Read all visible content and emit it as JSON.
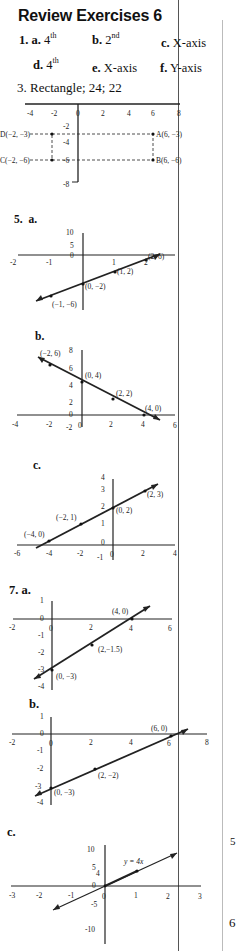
{
  "title": "Review Exercises 6",
  "exercise1": {
    "number": "1.",
    "items": [
      {
        "letter": "a.",
        "answer": "4",
        "sup": "th"
      },
      {
        "letter": "b.",
        "answer": "2",
        "sup": "nd"
      },
      {
        "letter": "c.",
        "answer": "X-axis"
      },
      {
        "letter": "d.",
        "answer": "4",
        "sup": "th"
      },
      {
        "letter": "e.",
        "answer": "X-axis"
      },
      {
        "letter": "f.",
        "answer": "Y-axis"
      }
    ]
  },
  "exercise3": {
    "label": "3. Rectangle; 24; 22",
    "graph": {
      "x_ticks": [
        "-4",
        "-2",
        "0",
        "2",
        "4",
        "6",
        "8"
      ],
      "y_ticks": [
        "-2",
        "-4",
        "-6",
        "-8"
      ],
      "points": [
        {
          "name": "A",
          "label": "A(6, −3)"
        },
        {
          "name": "B",
          "label": "B(6, −6)"
        },
        {
          "name": "C",
          "label": "C(−2, −6)"
        },
        {
          "name": "D",
          "label": "D(−2, −3)"
        }
      ]
    }
  },
  "exercise5": {
    "number": "5.",
    "parts": [
      {
        "letter": "a.",
        "x_ticks": [
          "-2",
          "-1",
          "0",
          "1",
          "2"
        ],
        "y_ticks": [
          "10",
          "5",
          "0"
        ],
        "points": [
          "(2, 6)",
          "(1, 2)",
          "(0, −2)",
          "(−1, −6)"
        ]
      },
      {
        "letter": "b.",
        "x_ticks": [
          "-4",
          "-2",
          "0",
          "2",
          "4",
          "6"
        ],
        "y_ticks": [
          "8",
          "6",
          "4",
          "2",
          "0",
          "-2"
        ],
        "points": [
          "(−2, 6)",
          "(0, 4)",
          "(2, 2)",
          "(4, 0)"
        ]
      },
      {
        "letter": "c.",
        "x_ticks": [
          "-6",
          "-4",
          "-2",
          "0",
          "2",
          "4"
        ],
        "y_ticks": [
          "4",
          "3",
          "2",
          "1",
          "0",
          "-1"
        ],
        "points": [
          "(2, 3)",
          "(0, 2)",
          "(−2, 1)",
          "(−4, 0)"
        ]
      }
    ]
  },
  "exercise7": {
    "number": "7.",
    "parts": [
      {
        "letter": "a.",
        "x_ticks": [
          "-2",
          "0",
          "2",
          "4",
          "6"
        ],
        "y_ticks": [
          "1",
          "0",
          "-1",
          "-2",
          "-3",
          "-4"
        ],
        "points": [
          "(4, 0)",
          "(2,−1.5)",
          "(0, −3)"
        ]
      },
      {
        "letter": "b.",
        "x_ticks": [
          "-2",
          "0",
          "2",
          "4",
          "6",
          "8"
        ],
        "y_ticks": [
          "1",
          "0",
          "-1",
          "-2",
          "-3",
          "-4"
        ],
        "points": [
          "(6, 0)",
          "(2, −2)",
          "(0, −3)"
        ]
      },
      {
        "letter": "c.",
        "x_ticks": [
          "-3",
          "-2",
          "-1",
          "0",
          "1",
          "2",
          "3"
        ],
        "y_ticks": [
          "10",
          "5",
          "4",
          "0",
          "-5",
          "-10"
        ],
        "equation": "y = 4x"
      }
    ]
  },
  "margin_fragments": [
    "5",
    "6"
  ]
}
